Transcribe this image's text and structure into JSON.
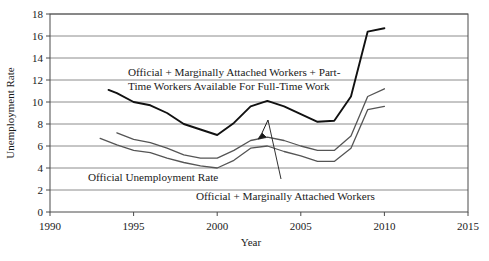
{
  "chart_data": {
    "type": "line",
    "title": "",
    "xlabel": "Year",
    "ylabel": "Unemployment Rate",
    "xlim": [
      1990,
      2015
    ],
    "ylim": [
      0,
      18
    ],
    "xticks": [
      1990,
      1995,
      2000,
      2005,
      2010,
      2015
    ],
    "xtick_labels": [
      "1990",
      "1995",
      "2000",
      "2005",
      "2010",
      "2015"
    ],
    "yticks": [
      0,
      2,
      4,
      6,
      8,
      10,
      12,
      14,
      16,
      18
    ],
    "ytick_labels": [
      "0",
      "2",
      "4",
      "6",
      "8",
      "10",
      "12",
      "14",
      "16",
      "18"
    ],
    "grid": "horizontal",
    "legend_position": "none",
    "series": [
      {
        "name": "Official + Marginally Attached Workers + Part-Time Workers Available For Full-Time Work",
        "color": "#111111",
        "width": 1.9,
        "x": [
          1993.5,
          1994,
          1995,
          1996,
          1997,
          1998,
          1999,
          2000,
          2001,
          2002,
          2003,
          2004,
          2005,
          2006,
          2007,
          2008,
          2009,
          2010
        ],
        "values": [
          11.1,
          10.8,
          10.0,
          9.7,
          9.0,
          8.0,
          7.5,
          7.0,
          8.1,
          9.6,
          10.1,
          9.6,
          8.9,
          8.2,
          8.3,
          10.5,
          16.4,
          16.7
        ]
      },
      {
        "name": "Official + Marginally Attached Workers",
        "color": "#555555",
        "width": 1.3,
        "x": [
          1994,
          1995,
          1996,
          1997,
          1998,
          1999,
          2000,
          2001,
          2002,
          2003,
          2004,
          2005,
          2006,
          2007,
          2008,
          2009,
          2010
        ],
        "values": [
          7.2,
          6.6,
          6.3,
          5.8,
          5.2,
          4.9,
          4.9,
          5.6,
          6.5,
          6.8,
          6.5,
          6.0,
          5.6,
          5.6,
          6.9,
          10.5,
          11.2
        ]
      },
      {
        "name": "Official Unemployment Rate",
        "color": "#555555",
        "width": 1.3,
        "x": [
          1993,
          1994,
          1995,
          1996,
          1997,
          1998,
          1999,
          2000,
          2001,
          2002,
          2003,
          2004,
          2005,
          2006,
          2007,
          2008,
          2009,
          2010
        ],
        "values": [
          6.7,
          6.1,
          5.6,
          5.4,
          4.9,
          4.5,
          4.2,
          4.0,
          4.7,
          5.8,
          6.0,
          5.5,
          5.1,
          4.6,
          4.6,
          5.8,
          9.3,
          9.6
        ]
      }
    ],
    "annotations": [
      {
        "id": "annot-top",
        "lines": [
          "Official + Marginally Attached Workers + Part-",
          "Time Workers Available For Full-Time Work"
        ]
      },
      {
        "id": "annot-official",
        "lines": [
          "Official Unemployment Rate"
        ]
      },
      {
        "id": "annot-marginally",
        "lines": [
          "Official + Marginally Attached Workers"
        ]
      }
    ]
  }
}
